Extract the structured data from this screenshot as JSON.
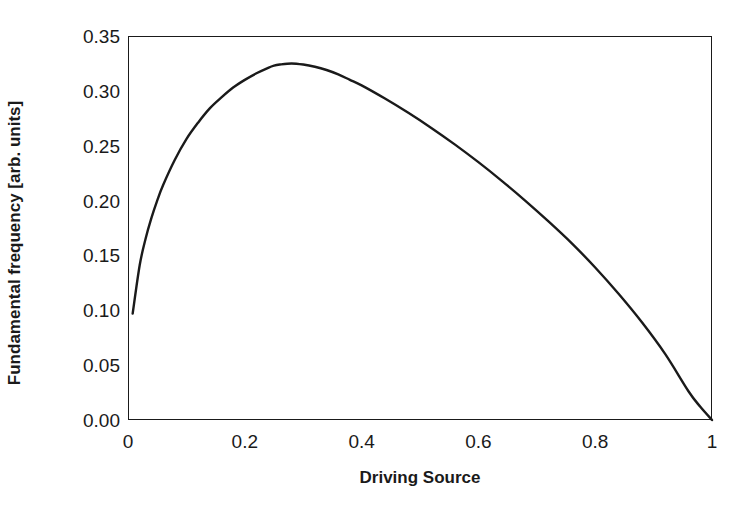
{
  "chart_data": {
    "type": "line",
    "title": "",
    "subtitle": "",
    "xlabel": "Driving Source",
    "ylabel": "Fundamental frequency [arb. units]",
    "xlim": [
      0,
      1
    ],
    "ylim": [
      0,
      0.35
    ],
    "xticks": [
      "0",
      "0.2",
      "0.4",
      "0.6",
      "0.8",
      "1"
    ],
    "xtick_values": [
      0,
      0.2,
      0.4,
      0.6,
      0.8,
      1
    ],
    "yticks": [
      "0.00",
      "0.05",
      "0.10",
      "0.15",
      "0.20",
      "0.25",
      "0.30",
      "0.35"
    ],
    "ytick_values": [
      0.0,
      0.05,
      0.1,
      0.15,
      0.2,
      0.25,
      0.3,
      0.35
    ],
    "grid": false,
    "legend": "none",
    "line_color": "#1a1a1a",
    "line_width": 2.4,
    "series": [
      {
        "name": "Fundamental frequency",
        "x": [
          0.008,
          0.02,
          0.03,
          0.04,
          0.05,
          0.06,
          0.08,
          0.1,
          0.12,
          0.14,
          0.16,
          0.18,
          0.2,
          0.22,
          0.24,
          0.25,
          0.26,
          0.28,
          0.3,
          0.32,
          0.34,
          0.36,
          0.38,
          0.4,
          0.44,
          0.48,
          0.52,
          0.56,
          0.6,
          0.64,
          0.68,
          0.72,
          0.76,
          0.8,
          0.84,
          0.88,
          0.92,
          0.96,
          0.98,
          1.0
        ],
        "y": [
          0.097,
          0.141,
          0.165,
          0.184,
          0.2,
          0.214,
          0.237,
          0.256,
          0.271,
          0.284,
          0.294,
          0.303,
          0.31,
          0.316,
          0.321,
          0.323,
          0.324,
          0.325,
          0.324,
          0.322,
          0.319,
          0.315,
          0.31,
          0.305,
          0.293,
          0.28,
          0.266,
          0.251,
          0.235,
          0.218,
          0.2,
          0.181,
          0.161,
          0.139,
          0.115,
          0.089,
          0.06,
          0.026,
          0.012,
          0.0
        ]
      }
    ]
  },
  "axes": {
    "frame_color": "#1a1a1a"
  }
}
